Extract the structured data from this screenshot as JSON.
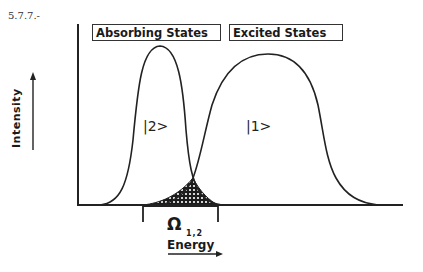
{
  "figure": {
    "number": "5.7.7.-"
  },
  "labels": {
    "absorbing": "Absorbing States",
    "excited": "Excited States",
    "state2": "|2>",
    "state1": "|1>",
    "omega": "Ω",
    "omega_subscript": "1,2",
    "x_axis": "Energy",
    "y_axis": "Intensity"
  },
  "colors": {
    "line": "#222222",
    "background": "#ffffff",
    "overlap_fill": "#1a1a1a"
  }
}
